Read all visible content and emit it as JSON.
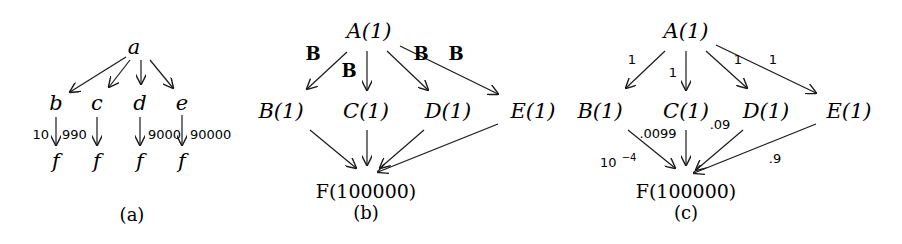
{
  "panels": [
    {
      "caption": "(a)",
      "nodes": {
        "a": "a",
        "b": "b",
        "c": "c",
        "d": "d",
        "e": "e",
        "f1": "f",
        "f2": "f",
        "f3": "f",
        "f4": "f"
      },
      "edge_labels": {
        "b_f": "10",
        "c_f": "990",
        "d_f": "9000",
        "e_f": "90000"
      }
    },
    {
      "caption": "(b)",
      "nodes": {
        "A": "A(1)",
        "B": "B(1)",
        "C": "C(1)",
        "D": "D(1)",
        "E": "E(1)",
        "F": "F(100000)"
      },
      "edge_labels": {
        "A_B": "B",
        "A_C": "B",
        "A_D": "B",
        "A_E": "B"
      }
    },
    {
      "caption": "(c)",
      "nodes": {
        "A": "A(1)",
        "B": "B(1)",
        "C": "C(1)",
        "D": "D(1)",
        "E": "E(1)",
        "F": "F(100000)"
      },
      "edge_labels": {
        "A_B": "1",
        "A_C": "1",
        "A_D": "1",
        "A_E": "1",
        "B_F": "10",
        "B_F_exp": "−4",
        "C_F": ".0099",
        "D_F": ".09",
        "E_F": ".9"
      }
    }
  ]
}
